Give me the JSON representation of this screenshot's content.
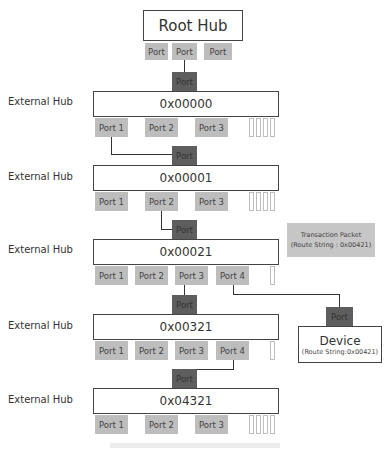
{
  "root_hub": {
    "label": "Root Hub",
    "ports": [
      "Port",
      "Port",
      "Port"
    ]
  },
  "upstream_port_label": "Port",
  "hubs": [
    {
      "side_label": "External Hub",
      "address": "0x00000",
      "ports": [
        "Port 1",
        "Port 2",
        "Port 3"
      ]
    },
    {
      "side_label": "External Hub",
      "address": "0x00001",
      "ports": [
        "Port 1",
        "Port 2",
        "Port 3"
      ]
    },
    {
      "side_label": "External Hub",
      "address": "0x00021",
      "ports": [
        "Port 1",
        "Port 2",
        "Port 3",
        "Port 4"
      ]
    },
    {
      "side_label": "External Hub",
      "address": "0x00321",
      "ports": [
        "Port 1",
        "Port 2",
        "Port 3",
        "Port 4"
      ]
    },
    {
      "side_label": "External Hub",
      "address": "0x04321",
      "ports": [
        "Port 1",
        "Port 2",
        "Port 3"
      ]
    }
  ],
  "transaction_packet": {
    "title": "Transaction Packet",
    "route": "(Route String : 0x00421)"
  },
  "device": {
    "port": "Port",
    "title": "Device",
    "route": "(Route String:0x00421)"
  },
  "colors": {
    "port": "#bdbdbd",
    "upstream_port": "#5e5e5e",
    "border": "#444444",
    "packet": "#c6c6c6"
  }
}
